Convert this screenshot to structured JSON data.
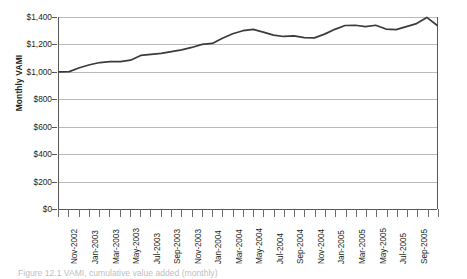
{
  "figure": {
    "caption": "Figure 12.1  VAMI, cumulative value added (monthly)"
  },
  "chart_data": {
    "type": "line",
    "title": "",
    "xlabel": "",
    "ylabel": "Monthly VAMI",
    "ylim": [
      0,
      1400
    ],
    "y_ticks": [
      0,
      200,
      400,
      600,
      800,
      1000,
      1200,
      1400
    ],
    "y_tick_labels": [
      "$0",
      "$200",
      "$400",
      "$600",
      "$800",
      "$1,000",
      "$1,200",
      "$1,400"
    ],
    "grid": "horizontal",
    "legend": "none",
    "line_color": "#3b3b3d",
    "gridline_color": "#b9bbbd",
    "axis_color": "#58585a",
    "x_tick_labels": [
      "Nov-2002",
      "Jan-2003",
      "Mar-2003",
      "May-2003",
      "Jul-2003",
      "Sep-2003",
      "Nov-2003",
      "Jan-2004",
      "Mar-2004",
      "May-2004",
      "Jul-2004",
      "Sep-2004",
      "Nov-2004",
      "Jan-2005",
      "Mar-2005",
      "May-2005",
      "Jul-2005",
      "Sep-2005"
    ],
    "x": [
      "Oct-2002",
      "Nov-2002",
      "Dec-2002",
      "Jan-2003",
      "Feb-2003",
      "Mar-2003",
      "Apr-2003",
      "May-2003",
      "Jun-2003",
      "Jul-2003",
      "Aug-2003",
      "Sep-2003",
      "Oct-2003",
      "Nov-2003",
      "Dec-2003",
      "Jan-2004",
      "Feb-2004",
      "Mar-2004",
      "Apr-2004",
      "May-2004",
      "Jun-2004",
      "Jul-2004",
      "Aug-2004",
      "Sep-2004",
      "Oct-2004",
      "Nov-2004",
      "Dec-2004",
      "Jan-2005",
      "Feb-2005",
      "Mar-2005",
      "Apr-2005",
      "May-2005",
      "Jun-2005",
      "Jul-2005",
      "Aug-2005",
      "Sep-2005"
    ],
    "values": [
      1000,
      1002,
      1030,
      1052,
      1068,
      1075,
      1074,
      1085,
      1120,
      1127,
      1135,
      1148,
      1160,
      1178,
      1200,
      1207,
      1245,
      1278,
      1300,
      1310,
      1290,
      1268,
      1258,
      1262,
      1250,
      1248,
      1275,
      1310,
      1338,
      1340,
      1330,
      1340,
      1312,
      1308,
      1330,
      1352
    ],
    "extra_points": [
      {
        "x": "Aug-2005b",
        "value": 1397
      },
      {
        "x": "Sep-2005b",
        "value": 1340
      }
    ],
    "start_value": 1000,
    "peak_value": 1397,
    "end_value": 1340
  }
}
